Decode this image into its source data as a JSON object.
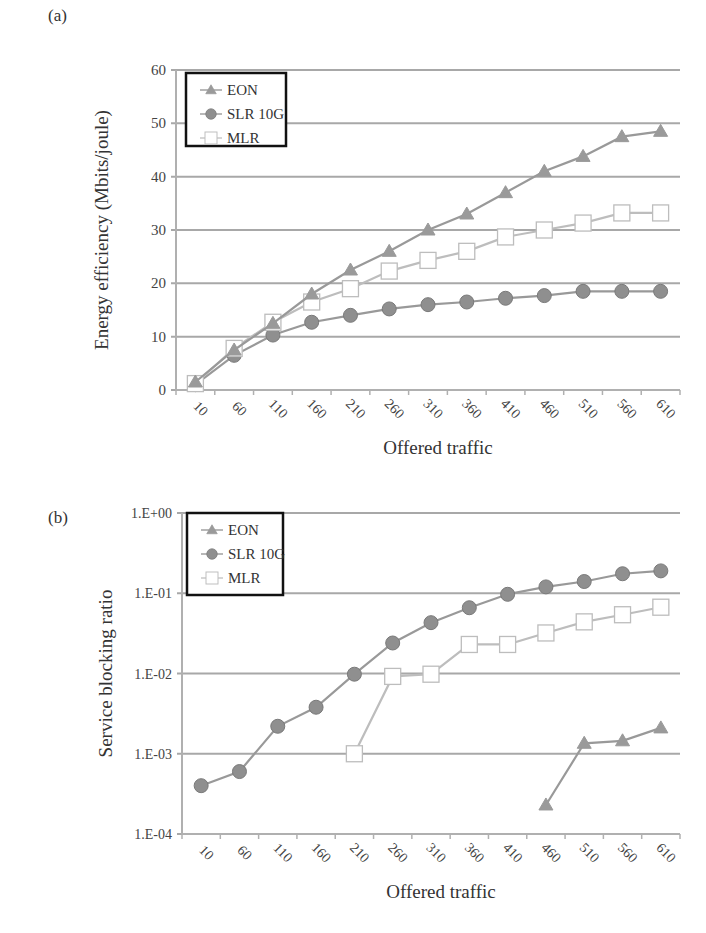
{
  "figure": {
    "panels": [
      {
        "label": "(a)"
      },
      {
        "label": "(b)"
      }
    ]
  },
  "chart_data": [
    {
      "type": "line",
      "panel": "(a)",
      "title": "",
      "xlabel": "Offered traffic",
      "ylabel": "Energy efficiency (Mbits/joule)",
      "categories": [
        "10",
        "60",
        "110",
        "160",
        "210",
        "260",
        "310",
        "360",
        "410",
        "460",
        "510",
        "560",
        "610"
      ],
      "yticks": [
        "0",
        "10",
        "20",
        "30",
        "40",
        "50",
        "60"
      ],
      "ylim": [
        0,
        60
      ],
      "grid": true,
      "legend_position": "top-left",
      "series": [
        {
          "name": "EON",
          "marker": "triangle",
          "color": "#9a9a9a",
          "values": [
            1.5,
            7.5,
            12.5,
            18.0,
            22.5,
            26.0,
            30.0,
            33.0,
            37.0,
            41.0,
            43.8,
            47.5,
            48.5
          ]
        },
        {
          "name": "SLR 10G",
          "marker": "circle",
          "color": "#8f8f8f",
          "values": [
            1.0,
            6.5,
            10.3,
            12.7,
            14.0,
            15.2,
            16.0,
            16.5,
            17.2,
            17.7,
            18.5,
            18.5,
            18.5
          ]
        },
        {
          "name": "MLR",
          "marker": "square",
          "color": "#bdbdbd",
          "values": [
            1.2,
            7.8,
            12.7,
            16.5,
            19.0,
            22.3,
            24.3,
            26.0,
            28.7,
            30.0,
            31.3,
            33.2,
            33.2
          ]
        }
      ]
    },
    {
      "type": "line",
      "panel": "(b)",
      "title": "",
      "xlabel": "Offered traffic",
      "ylabel": "Service blocking ratio",
      "categories": [
        "10",
        "60",
        "110",
        "160",
        "210",
        "260",
        "310",
        "360",
        "410",
        "460",
        "510",
        "560",
        "610"
      ],
      "yscale": "log",
      "yticks": [
        "1.E-04",
        "1.E-03",
        "1.E-02",
        "1.E-01",
        "1.E+00"
      ],
      "ylim": [
        0.0001,
        1
      ],
      "grid": true,
      "legend_position": "top-left",
      "series": [
        {
          "name": "EON",
          "marker": "triangle",
          "color": "#9a9a9a",
          "values": [
            null,
            null,
            null,
            null,
            null,
            null,
            null,
            null,
            null,
            0.00023,
            0.00135,
            0.00145,
            0.0021
          ]
        },
        {
          "name": "SLR 10G",
          "marker": "circle",
          "color": "#8f8f8f",
          "values": [
            0.0004,
            0.0006,
            0.0022,
            0.0038,
            0.0098,
            0.024,
            0.043,
            0.066,
            0.097,
            0.12,
            0.14,
            0.175,
            0.19
          ]
        },
        {
          "name": "MLR",
          "marker": "square",
          "color": "#bdbdbd",
          "values": [
            null,
            null,
            null,
            null,
            0.001,
            0.0092,
            0.0098,
            0.023,
            0.023,
            0.032,
            0.044,
            0.054,
            0.067
          ]
        }
      ]
    }
  ]
}
